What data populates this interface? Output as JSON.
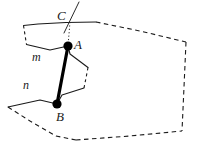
{
  "figure": {
    "kind": "geometry-diagram",
    "width": 201,
    "height": 146,
    "background_color": "#ffffff",
    "stroke_color": "#1a1a1a",
    "segment_color": "#000000"
  },
  "labels": {
    "point_c": "C",
    "point_a": "A",
    "point_b": "B",
    "plane_m": "m",
    "plane_n": "n"
  },
  "label_positions": {
    "point_c": {
      "x": 57,
      "y": 9
    },
    "point_a": {
      "x": 74,
      "y": 38
    },
    "point_b": {
      "x": 56,
      "y": 110
    },
    "plane_m": {
      "x": 32,
      "y": 51
    },
    "plane_n": {
      "x": 23,
      "y": 79
    }
  },
  "points": [
    {
      "name": "A",
      "x": 68,
      "y": 46,
      "marker": "filled-dot",
      "radius": 4.6
    },
    {
      "name": "B",
      "x": 57,
      "y": 104,
      "marker": "filled-dot",
      "radius": 4.6
    },
    {
      "name": "C",
      "x": 70,
      "y": 22,
      "marker": "none",
      "radius": 0
    }
  ],
  "geometry": {
    "plane_m_solid_top": "M 23.5 25.5 L 38 24 L 66 22.5 L 96 22",
    "plane_m_dashed_top_right": "M 96 22 L 140 31 L 186 42",
    "plane_m_dashed_left": "M 23.5 25.5 L 25 35 L 26.5 44.5",
    "plane_m_solid_front": "M 26.5 44.5 L 50 50 L 68 46 L 70 54 L 88 67.5",
    "plane_m_dashed_right_edge": "M 88 67.5 L 86 78 L 84 88",
    "plane_n_solid_top": "M 8 107 L 40 100 L 57 104 L 62 95 L 84 88",
    "plane_n_dashed_left": "M 8 107 L 30 121 L 56 136 L 76 140",
    "plane_n_dashed_bottom": "M 76 140 L 130 136 L 182 131",
    "plane_right_dashed_side": "M 186 42 L 184 87 L 182 131",
    "segment_ab": "M 68 46 L 57 104",
    "dotted_ca": "M 70 22 L 68 46",
    "line_through_c": "M 64 33 L 79 2"
  },
  "stroke_widths": {
    "plane_edge": 1.1,
    "segment_ab": 3.2,
    "dotted": 1.0,
    "slant_line": 1.0
  },
  "dash_patterns": {
    "plane_dash": "4.5 3.5",
    "short_dash": "3 3",
    "dotted": "1.2 2.2"
  }
}
